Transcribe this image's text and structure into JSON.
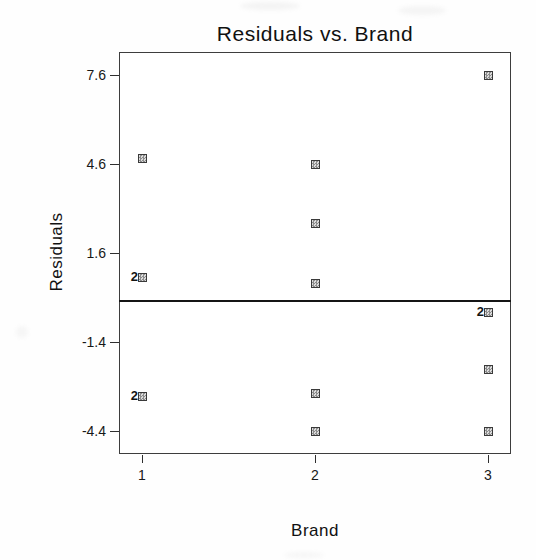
{
  "figure": {
    "title": "Residuals vs. Brand",
    "x_axis": {
      "label": "Brand",
      "tick_labels": [
        "1",
        "2",
        "3"
      ]
    },
    "y_axis": {
      "label": "Residuals",
      "tick_labels": [
        "7.6",
        "4.6",
        "1.6",
        "-1.4",
        "-4.4"
      ]
    }
  },
  "colors": {
    "background": "#ffffff",
    "plot_border": "#3d3d3d",
    "zero_line": "#151515",
    "marker_border": "#3a3a3a",
    "marker_fill_dark": "#8d8d8d",
    "marker_fill_light": "#dcdcdc",
    "text": "#1a1a1a"
  },
  "chart_data": {
    "type": "scatter",
    "title": "Residuals vs. Brand",
    "xlabel": "Brand",
    "ylabel": "Residuals",
    "x_ticks": [
      1,
      2,
      3
    ],
    "y_ticks": [
      7.6,
      4.6,
      1.6,
      -1.4,
      -4.4
    ],
    "xlim": [
      0.87,
      3.13
    ],
    "ylim": [
      -5.17,
      8.38
    ],
    "reference_line_y": 0,
    "grid": false,
    "legend": "none",
    "overlap_label_style": "count shown as numeral left of marker",
    "points": [
      {
        "brand": 1,
        "residual": 4.8,
        "count": 1
      },
      {
        "brand": 1,
        "residual": 0.8,
        "count": 2
      },
      {
        "brand": 1,
        "residual": -3.2,
        "count": 2
      },
      {
        "brand": 2,
        "residual": 4.6,
        "count": 1
      },
      {
        "brand": 2,
        "residual": 2.6,
        "count": 1
      },
      {
        "brand": 2,
        "residual": 0.6,
        "count": 1
      },
      {
        "brand": 2,
        "residual": -3.1,
        "count": 1
      },
      {
        "brand": 2,
        "residual": -4.4,
        "count": 1
      },
      {
        "brand": 3,
        "residual": 7.6,
        "count": 1
      },
      {
        "brand": 3,
        "residual": -0.4,
        "count": 2
      },
      {
        "brand": 3,
        "residual": -2.3,
        "count": 1
      },
      {
        "brand": 3,
        "residual": -4.4,
        "count": 1
      }
    ]
  }
}
